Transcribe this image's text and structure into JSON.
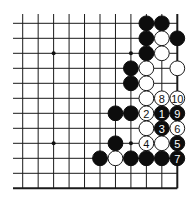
{
  "diagram": {
    "type": "go-board-fragment",
    "grid": {
      "columns": 11,
      "rows": 12,
      "x_start": 22.7,
      "y_start": 23.3,
      "x_step": 15.46,
      "y_step": 15.0,
      "open_left": true,
      "open_top": true,
      "edge_right": true,
      "edge_bottom": true
    },
    "colors": {
      "line": "#1a1a1a",
      "black_stone": "#0d0d0d",
      "white_stone": "#ffffff",
      "background": "#ffffff"
    },
    "star_points": [
      {
        "col": 2,
        "row": 2
      },
      {
        "col": 7,
        "row": 2
      },
      {
        "col": 2,
        "row": 8
      },
      {
        "col": 7,
        "row": 8
      }
    ],
    "stones": [
      {
        "col": 8,
        "row": 0,
        "color": "black",
        "label": ""
      },
      {
        "col": 9,
        "row": 0,
        "color": "black",
        "label": ""
      },
      {
        "col": 8,
        "row": 1,
        "color": "black",
        "label": ""
      },
      {
        "col": 9,
        "row": 1,
        "color": "white",
        "label": ""
      },
      {
        "col": 10,
        "row": 1,
        "color": "black",
        "label": ""
      },
      {
        "col": 8,
        "row": 2,
        "color": "black",
        "label": ""
      },
      {
        "col": 9,
        "row": 2,
        "color": "white",
        "label": ""
      },
      {
        "col": 7,
        "row": 3,
        "color": "black",
        "label": ""
      },
      {
        "col": 8,
        "row": 3,
        "color": "white",
        "label": ""
      },
      {
        "col": 10,
        "row": 3,
        "color": "white",
        "label": ""
      },
      {
        "col": 7,
        "row": 4,
        "color": "black",
        "label": ""
      },
      {
        "col": 8,
        "row": 4,
        "color": "white",
        "label": ""
      },
      {
        "col": 8,
        "row": 5,
        "color": "white",
        "label": ""
      },
      {
        "col": 9,
        "row": 5,
        "color": "white",
        "label": "8"
      },
      {
        "col": 10,
        "row": 5,
        "color": "white",
        "label": "10"
      },
      {
        "col": 6,
        "row": 6,
        "color": "black",
        "label": ""
      },
      {
        "col": 7,
        "row": 6,
        "color": "black",
        "label": ""
      },
      {
        "col": 8,
        "row": 6,
        "color": "white",
        "label": "2"
      },
      {
        "col": 9,
        "row": 6,
        "color": "black",
        "label": "1"
      },
      {
        "col": 10,
        "row": 6,
        "color": "black",
        "label": "9"
      },
      {
        "col": 8,
        "row": 7,
        "color": "white",
        "label": ""
      },
      {
        "col": 9,
        "row": 7,
        "color": "black",
        "label": "3"
      },
      {
        "col": 10,
        "row": 7,
        "color": "white",
        "label": "6"
      },
      {
        "col": 6,
        "row": 8,
        "color": "black",
        "label": ""
      },
      {
        "col": 8,
        "row": 8,
        "color": "white",
        "label": "4"
      },
      {
        "col": 9,
        "row": 8,
        "color": "white",
        "label": ""
      },
      {
        "col": 10,
        "row": 8,
        "color": "black",
        "label": "5"
      },
      {
        "col": 5,
        "row": 9,
        "color": "black",
        "label": ""
      },
      {
        "col": 6,
        "row": 9,
        "color": "white",
        "label": ""
      },
      {
        "col": 7,
        "row": 9,
        "color": "black",
        "label": ""
      },
      {
        "col": 8,
        "row": 9,
        "color": "black",
        "label": ""
      },
      {
        "col": 9,
        "row": 9,
        "color": "black",
        "label": ""
      },
      {
        "col": 10,
        "row": 9,
        "color": "black",
        "label": "7"
      }
    ]
  }
}
